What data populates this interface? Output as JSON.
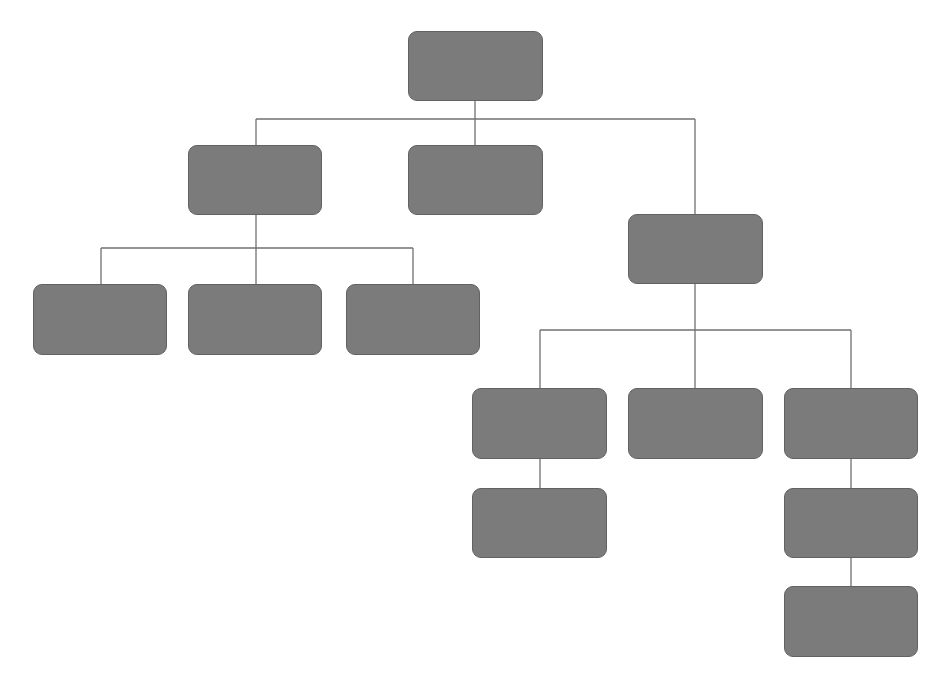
{
  "diagram": {
    "type": "org-chart",
    "colors": {
      "node_fill": "#7b7b7b",
      "node_border": "#626262",
      "edge": "#707070",
      "background": "#ffffff"
    },
    "nodes": [
      {
        "id": "n1",
        "label": "",
        "x": 408,
        "y": 31,
        "w": 135,
        "h": 70
      },
      {
        "id": "n2",
        "label": "",
        "x": 188,
        "y": 145,
        "w": 134,
        "h": 70
      },
      {
        "id": "n3",
        "label": "",
        "x": 408,
        "y": 145,
        "w": 135,
        "h": 70
      },
      {
        "id": "n4",
        "label": "",
        "x": 628,
        "y": 214,
        "w": 135,
        "h": 70
      },
      {
        "id": "n5",
        "label": "",
        "x": 33,
        "y": 284,
        "w": 134,
        "h": 71
      },
      {
        "id": "n6",
        "label": "",
        "x": 188,
        "y": 284,
        "w": 134,
        "h": 71
      },
      {
        "id": "n7",
        "label": "",
        "x": 346,
        "y": 284,
        "w": 134,
        "h": 71
      },
      {
        "id": "n8",
        "label": "",
        "x": 472,
        "y": 388,
        "w": 135,
        "h": 71
      },
      {
        "id": "n9",
        "label": "",
        "x": 628,
        "y": 388,
        "w": 135,
        "h": 71
      },
      {
        "id": "n10",
        "label": "",
        "x": 784,
        "y": 388,
        "w": 134,
        "h": 71
      },
      {
        "id": "n11",
        "label": "",
        "x": 472,
        "y": 488,
        "w": 135,
        "h": 70
      },
      {
        "id": "n12",
        "label": "",
        "x": 784,
        "y": 488,
        "w": 134,
        "h": 70
      },
      {
        "id": "n13",
        "label": "",
        "x": 784,
        "y": 586,
        "w": 134,
        "h": 71
      }
    ],
    "edges": [
      {
        "from": "n1",
        "to": "n2"
      },
      {
        "from": "n1",
        "to": "n3"
      },
      {
        "from": "n1",
        "to": "n4"
      },
      {
        "from": "n2",
        "to": "n5"
      },
      {
        "from": "n2",
        "to": "n6"
      },
      {
        "from": "n2",
        "to": "n7"
      },
      {
        "from": "n4",
        "to": "n8"
      },
      {
        "from": "n4",
        "to": "n9"
      },
      {
        "from": "n4",
        "to": "n10"
      },
      {
        "from": "n8",
        "to": "n11"
      },
      {
        "from": "n10",
        "to": "n12"
      },
      {
        "from": "n12",
        "to": "n13"
      }
    ],
    "connector_segments": [
      {
        "x1": 475,
        "y1": 101,
        "x2": 475,
        "y2": 119
      },
      {
        "x1": 256,
        "y1": 119,
        "x2": 695,
        "y2": 119
      },
      {
        "x1": 256,
        "y1": 119,
        "x2": 256,
        "y2": 145
      },
      {
        "x1": 475,
        "y1": 119,
        "x2": 475,
        "y2": 145
      },
      {
        "x1": 695,
        "y1": 119,
        "x2": 695,
        "y2": 214
      },
      {
        "x1": 256,
        "y1": 215,
        "x2": 256,
        "y2": 248
      },
      {
        "x1": 101,
        "y1": 248,
        "x2": 413,
        "y2": 248
      },
      {
        "x1": 101,
        "y1": 248,
        "x2": 101,
        "y2": 284
      },
      {
        "x1": 256,
        "y1": 248,
        "x2": 256,
        "y2": 284
      },
      {
        "x1": 413,
        "y1": 248,
        "x2": 413,
        "y2": 284
      },
      {
        "x1": 695,
        "y1": 284,
        "x2": 695,
        "y2": 330
      },
      {
        "x1": 540,
        "y1": 330,
        "x2": 851,
        "y2": 330
      },
      {
        "x1": 540,
        "y1": 330,
        "x2": 540,
        "y2": 388
      },
      {
        "x1": 695,
        "y1": 330,
        "x2": 695,
        "y2": 388
      },
      {
        "x1": 851,
        "y1": 330,
        "x2": 851,
        "y2": 388
      },
      {
        "x1": 540,
        "y1": 459,
        "x2": 540,
        "y2": 488
      },
      {
        "x1": 851,
        "y1": 459,
        "x2": 851,
        "y2": 488
      },
      {
        "x1": 851,
        "y1": 558,
        "x2": 851,
        "y2": 586
      }
    ]
  }
}
